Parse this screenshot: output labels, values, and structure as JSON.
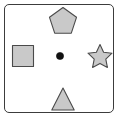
{
  "figure": {
    "background_color": "#ffffff",
    "frame": {
      "border_color": "#3c3c3c",
      "fill_color": "#ffffff",
      "corner_radius": 5,
      "x": 4,
      "y": 4,
      "width": 110,
      "height": 109
    },
    "shape_fill_color": "#c9c9c9",
    "shape_stroke_color": "#4a4a4a",
    "dot_color": "#111111"
  },
  "shapes": [
    {
      "id": "pentagon",
      "name": "pentagon",
      "label": "Pentagon",
      "position": "top-center",
      "center_x": 63,
      "center_y": 20,
      "size": 26,
      "fill": "#c9c9c9",
      "stroke": "#4a4a4a",
      "sides": 5
    },
    {
      "id": "square",
      "name": "square",
      "label": "Square",
      "position": "middle-left",
      "center_x": 23,
      "center_y": 56,
      "size": 22,
      "fill": "#c9c9c9",
      "stroke": "#4a4a4a",
      "sides": 4
    },
    {
      "id": "dot",
      "name": "dot",
      "label": "Dot",
      "position": "center",
      "center_x": 60,
      "center_y": 56,
      "size": 7,
      "fill": "#111111",
      "stroke": "#111111",
      "sides": 0
    },
    {
      "id": "star",
      "name": "star",
      "label": "Star",
      "position": "middle-right",
      "center_x": 100,
      "center_y": 56,
      "size": 24,
      "fill": "#c9c9c9",
      "stroke": "#4a4a4a",
      "points": 5
    },
    {
      "id": "triangle",
      "name": "triangle",
      "label": "Triangle",
      "position": "bottom-center",
      "center_x": 63,
      "center_y": 99,
      "size": 22,
      "fill": "#c9c9c9",
      "stroke": "#4a4a4a",
      "sides": 3
    }
  ]
}
